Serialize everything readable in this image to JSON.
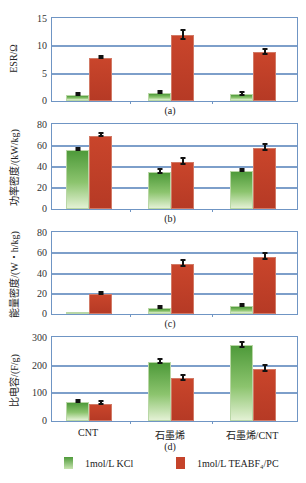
{
  "chart_data": [
    {
      "type": "bar",
      "panel": "(a)",
      "title": "",
      "xlabel": "",
      "ylabel": "ESR/Ω",
      "ylim": [
        0,
        15
      ],
      "yticks": [
        0,
        5,
        10,
        15
      ],
      "grid": true,
      "categories": [
        "CNT",
        "石墨烯",
        "石墨烯/CNT"
      ],
      "series": [
        {
          "name": "1mol/L KCl",
          "values": [
            1.1,
            1.5,
            1.2
          ],
          "errors": [
            0.1,
            0.2,
            0.2
          ]
        },
        {
          "name": "1mol/L TEABF₄/PC",
          "values": [
            7.9,
            12.0,
            8.9
          ],
          "errors": [
            0.2,
            0.8,
            0.5
          ]
        }
      ]
    },
    {
      "type": "bar",
      "panel": "(b)",
      "title": "",
      "xlabel": "",
      "ylabel": "功率密度/(kW/kg)",
      "ylim": [
        0,
        80
      ],
      "yticks": [
        0,
        20,
        40,
        60,
        80
      ],
      "grid": true,
      "categories": [
        "CNT",
        "石墨烯",
        "石墨烯/CNT"
      ],
      "series": [
        {
          "name": "1mol/L KCl",
          "values": [
            56,
            35,
            36
          ],
          "errors": [
            1,
            2,
            1
          ]
        },
        {
          "name": "1mol/L TEABF₄/PC",
          "values": [
            70,
            45,
            58
          ],
          "errors": [
            1,
            3,
            3
          ]
        }
      ]
    },
    {
      "type": "bar",
      "panel": "(c)",
      "title": "",
      "xlabel": "",
      "ylabel": "能量密度/(W・h/kg)",
      "ylim": [
        0,
        80
      ],
      "yticks": [
        0,
        20,
        40,
        60,
        80
      ],
      "grid": true,
      "categories": [
        "CNT",
        "石墨烯",
        "石墨烯/CNT"
      ],
      "series": [
        {
          "name": "1mol/L KCl",
          "values": [
            0.5,
            6,
            8
          ],
          "errors": [
            0.2,
            1,
            1
          ]
        },
        {
          "name": "1mol/L TEABF₄/PC",
          "values": [
            20,
            49,
            56
          ],
          "errors": [
            1,
            3,
            3
          ]
        }
      ]
    },
    {
      "type": "bar",
      "panel": "(d)",
      "title": "",
      "xlabel": "",
      "ylabel": "比电容/(F/g)",
      "ylim": [
        0,
        300
      ],
      "yticks": [
        0,
        100,
        200,
        300
      ],
      "grid": true,
      "categories": [
        "CNT",
        "石墨烯",
        "石墨烯/CNT"
      ],
      "series": [
        {
          "name": "1mol/L KCl",
          "values": [
            68,
            213,
            273
          ],
          "errors": [
            4,
            8,
            10
          ]
        },
        {
          "name": "1mol/L TEABF₄/PC",
          "values": [
            63,
            155,
            187
          ],
          "errors": [
            5,
            9,
            10
          ]
        }
      ]
    }
  ],
  "legend": {
    "position": "bottom",
    "items": [
      {
        "label": "1mol/L KCl",
        "color": "#6aae4f"
      },
      {
        "label": "1mol/L TEABF₄/PC",
        "color": "#c5432b"
      }
    ]
  },
  "colors": {
    "grid": "#6f95c4",
    "kcl": "#6aae4f",
    "teabf4": "#c5432b"
  }
}
